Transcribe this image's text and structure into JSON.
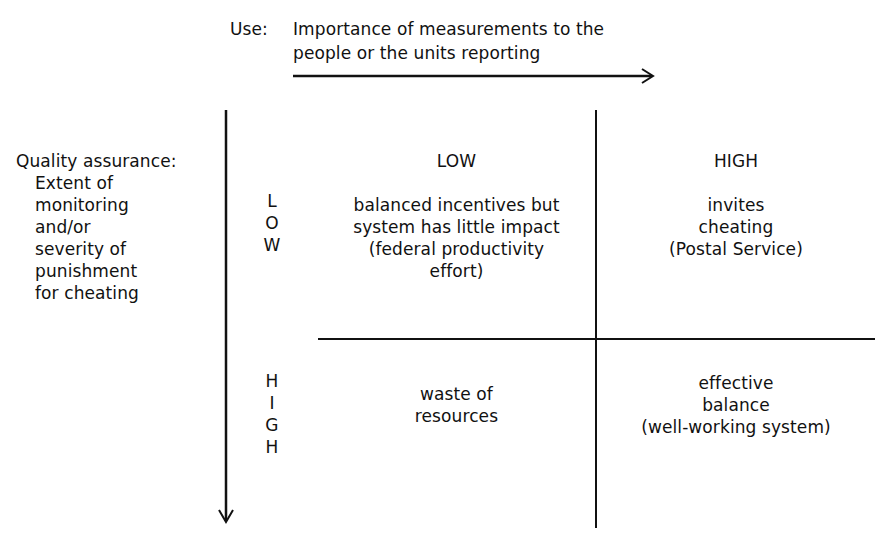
{
  "diagram": {
    "type": "2x2 matrix",
    "x_axis": {
      "prefix": "Use:",
      "label_line1": "Importance of measurements to the",
      "label_line2": "people or the units reporting",
      "direction": "right",
      "levels": [
        "LOW",
        "HIGH"
      ]
    },
    "y_axis": {
      "label_title": "Quality assurance:",
      "label_lines": [
        "Extent of",
        "monitoring",
        "and/or",
        "severity of",
        "punishment",
        "for cheating"
      ],
      "direction": "down",
      "levels": [
        {
          "name": "LOW",
          "letters": [
            "L",
            "O",
            "W"
          ]
        },
        {
          "name": "HIGH",
          "letters": [
            "H",
            "I",
            "G",
            "H"
          ]
        }
      ]
    },
    "cells": {
      "low_low": [
        "balanced incentives but",
        "system has little impact",
        "(federal productivity",
        "effort)"
      ],
      "low_high": [
        "invites",
        "cheating",
        "(Postal Service)"
      ],
      "high_low": [
        "waste of",
        "resources"
      ],
      "high_high": [
        "effective",
        "balance",
        "(well-working system)"
      ]
    }
  }
}
